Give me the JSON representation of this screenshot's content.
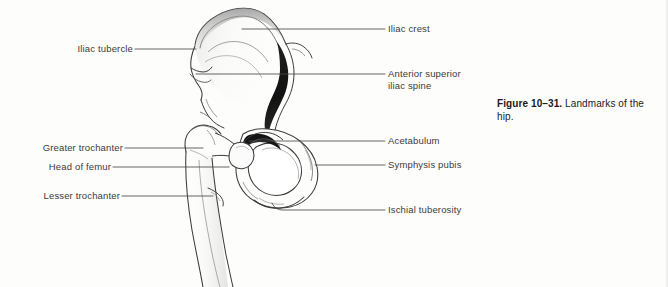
{
  "figure": {
    "number": "Figure 10–31.",
    "caption_text": " Landmarks of the hip.",
    "ink_color": "#3b3b3b",
    "shading_color": "#1c1c1c",
    "background_color": "#fdfdfc"
  },
  "labels": {
    "iliac_tubercle": "Iliac tubercle",
    "greater_trochanter": "Greater trochanter",
    "head_of_femur": "Head of femur",
    "lesser_trochanter": "Lesser trochanter",
    "iliac_crest": "Iliac crest",
    "anterior_superior_iliac_spine_line1": "Anterior superior",
    "anterior_superior_iliac_spine_line2": "iliac spine",
    "acetabulum": "Acetabulum",
    "symphysis_pubis": "Symphysis pubis",
    "ischial_tuberosity": "Ischial tuberosity"
  }
}
